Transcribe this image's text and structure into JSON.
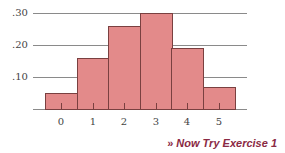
{
  "chart_data": {
    "type": "bar",
    "title": "",
    "xlabel": "",
    "ylabel": "",
    "categories": [
      "0",
      "1",
      "2",
      "3",
      "4",
      "5"
    ],
    "values": [
      0.05,
      0.16,
      0.26,
      0.3,
      0.19,
      0.07
    ],
    "ylim": [
      0,
      0.3
    ],
    "yticks": [
      ".10",
      ".20",
      ".30"
    ],
    "grid": true,
    "legend": null,
    "bar_color": "#e38a8a",
    "style": "histogram"
  },
  "footer": {
    "arrow": "»",
    "link_text": "Now Try Exercise 1",
    "color": "#8a2a44"
  }
}
